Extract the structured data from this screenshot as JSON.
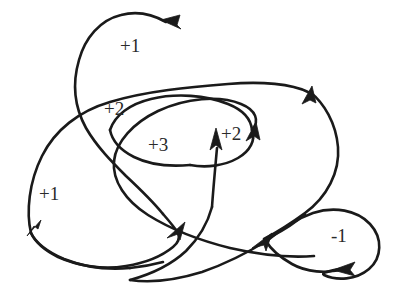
{
  "figure": {
    "kind": "curve-diagram",
    "background_color": "#ffffff",
    "stroke_color": "#1a1a1a",
    "label_color": "#2a2a2a",
    "width": 402,
    "height": 287
  },
  "labels": [
    {
      "id": "top-loop",
      "text": "+1",
      "x": 120,
      "y": 36
    },
    {
      "id": "upper-middle",
      "text": "+2",
      "x": 104,
      "y": 99
    },
    {
      "id": "inner-middle",
      "text": "+3",
      "x": 148,
      "y": 135
    },
    {
      "id": "right-inner",
      "text": "+2",
      "x": 221,
      "y": 124
    },
    {
      "id": "left-outer",
      "text": "+1",
      "x": 39,
      "y": 184
    },
    {
      "id": "right-lobe",
      "text": "-1",
      "x": 331,
      "y": 226
    }
  ],
  "arrowheads": [
    {
      "id": "top-arrow",
      "direction": "left",
      "x": 168,
      "y": 21
    },
    {
      "id": "right-upper-arrow",
      "direction": "up-right",
      "x": 310,
      "y": 91
    },
    {
      "id": "inner-right-arrow",
      "direction": "up-right",
      "x": 254,
      "y": 128
    },
    {
      "id": "inner-up-arrow",
      "direction": "up",
      "x": 217,
      "y": 139
    },
    {
      "id": "left-lower-arrow",
      "direction": "down-left",
      "x": 31,
      "y": 225
    },
    {
      "id": "center-low-arrow",
      "direction": "up-right",
      "x": 179,
      "y": 230
    },
    {
      "id": "lobe-entry-arrow",
      "direction": "up-right",
      "x": 262,
      "y": 240
    },
    {
      "id": "lobe-bottom-arrow",
      "direction": "left",
      "x": 345,
      "y": 267
    }
  ],
  "paths": {
    "main_curve": "M 168 21 C 140 9 106 16 88 44 C 70 72 70 104 84 128 C 98 152 120 168 140 186 C 160 204 178 220 179 230 C 180 242 166 254 150 261 C 124 272 96 268 72 256 C 48 244 34 234 31 225 C 26 206 30 176 44 150 C 58 124 84 108 114 100 C 160 88 214 86 258 82 C 296 79 320 84 310 91 C 322 100 336 120 338 144 C 340 170 328 196 304 212 C 288 222 276 232 262 240 C 230 256 190 268 160 274 C 130 280 110 272 104 256 C 98 238 104 214 114 192 C 126 166 146 150 170 144 C 200 136 212 140 217 139 C 228 136 242 132 254 128 C 262 120 258 110 244 104 C 222 96 190 98 162 110 C 134 122 116 142 114 160 C 112 180 124 200 146 214 C 170 229 200 240 228 247 C 256 254 290 258 316 256 C 345 254 345 267 345 267 C 360 272 375 266 382 252 C 390 236 386 216 372 204 C 356 191 332 188 312 196 C 292 204 276 218 262 240",
    "top_loop": "M 168 21 C 140 9 106 16 88 44 C 70 72 70 104 84 128 C 100 155 124 174 142 190",
    "upper_long": "M 31 225 C 26 206 30 176 44 150 C 58 124 84 108 114 100 C 160 88 214 86 258 82 C 284 79 302 84 310 91",
    "right_big": "M 310 91 C 324 101 337 121 339 146 C 341 172 328 197 304 213 C 287 224 275 232 262 240",
    "inner_loop_upper": "M 254 128 C 262 119 257 109 242 103 C 220 95 188 98 160 110 C 134 122 116 141 114 160",
    "inner_loop_lower": "M 114 160 C 112 180 125 200 147 214 C 171 229 201 240 229 247",
    "left_lobe": "M 142 190 C 160 206 176 220 179 230",
    "bottom_sweep": "M 179 230 C 180 242 166 253 150 260 C 124 271 96 268 72 256 C 50 245 34 234 31 225",
    "lobe": "M 345 267 C 361 272 376 265 383 251 C 390 235 385 215 371 203 C 355 190 331 188 311 196 C 292 204 276 218 262 240"
  }
}
